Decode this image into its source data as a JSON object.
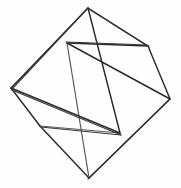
{
  "figure": {
    "type": "line-drawing",
    "width": 181,
    "height": 188,
    "background_color": "#fefefe",
    "stroke_color": "#2b2b2b",
    "stroke_color_light": "#5a5a5a",
    "stroke_width": 1.45,
    "vertex_count": 8,
    "edge_count": 12,
    "vertices": [
      {
        "id": "v-top",
        "label": "top",
        "x": 88,
        "y": 8
      },
      {
        "id": "v-upper-right",
        "label": "upper-right",
        "x": 148,
        "y": 46
      },
      {
        "id": "v-right",
        "label": "right",
        "x": 170,
        "y": 99
      },
      {
        "id": "v-bottom",
        "label": "bottom",
        "x": 89,
        "y": 178
      },
      {
        "id": "v-lower-left",
        "label": "lower-left",
        "x": 40,
        "y": 126
      },
      {
        "id": "v-left",
        "label": "left",
        "x": 11,
        "y": 88
      },
      {
        "id": "v-inner-upper",
        "label": "inner-upper",
        "x": 67,
        "y": 43
      },
      {
        "id": "v-inner-lower",
        "label": "inner-lower",
        "x": 120,
        "y": 133
      }
    ],
    "edges": [
      {
        "id": "e-1",
        "from": "v-top",
        "to": "v-upper-right",
        "path": "M 88 8 L 148 46",
        "weight": "normal"
      },
      {
        "id": "e-2",
        "from": "v-top",
        "to": "v-left",
        "path": "M 88 8 L 11 88",
        "weight": "normal"
      },
      {
        "id": "e-3",
        "from": "v-top",
        "to": "v-inner-lower",
        "path": "M 88 8 L 120 133",
        "weight": "normal"
      },
      {
        "id": "e-4",
        "from": "v-upper-right",
        "to": "v-right",
        "path": "M 148 46 L 170 99",
        "weight": "normal"
      },
      {
        "id": "e-5",
        "from": "v-upper-right",
        "to": "v-inner-upper",
        "path": "M 148 46 L 67 43",
        "weight": "normal"
      },
      {
        "id": "e-6",
        "from": "v-right",
        "to": "v-bottom",
        "path": "M 170 99 L 89 178",
        "weight": "normal"
      },
      {
        "id": "e-7",
        "from": "v-right",
        "to": "v-inner-upper",
        "path": "M 170 99 L 67 43",
        "weight": "normal"
      },
      {
        "id": "e-8",
        "from": "v-bottom",
        "to": "v-lower-left",
        "path": "M 89 178 L 40 126",
        "weight": "normal"
      },
      {
        "id": "e-9",
        "from": "v-bottom",
        "to": "v-inner-upper",
        "path": "M 89 178 L 67 43",
        "weight": "light"
      },
      {
        "id": "e-10",
        "from": "v-lower-left",
        "to": "v-left",
        "path": "M 40 126 L 11 88",
        "weight": "normal"
      },
      {
        "id": "e-11",
        "from": "v-lower-left",
        "to": "v-inner-lower",
        "path": "M 40 126 L 120 133",
        "weight": "light"
      },
      {
        "id": "e-12",
        "from": "v-left",
        "to": "v-inner-lower",
        "path": "M 11 88 L 120 133",
        "weight": "normal"
      }
    ],
    "sketch_overlays": [
      {
        "id": "o-1",
        "path": "M 89 9 L 149 47",
        "note": "double-stroke top-right"
      },
      {
        "id": "o-2",
        "path": "M 87 9 L 12 89",
        "note": "double-stroke top-left"
      },
      {
        "id": "o-3",
        "path": "M 169 100 L 88 179",
        "note": "double-stroke right-bottom"
      },
      {
        "id": "o-4",
        "path": "M 12 90 L 121 135",
        "note": "double-stroke left-inner"
      },
      {
        "id": "o-5",
        "path": "M 41 127 L 121 135",
        "note": "double-stroke lower-inner"
      },
      {
        "id": "o-6",
        "path": "M 147 45 L 66 42",
        "note": "double-stroke inner-upper"
      }
    ]
  }
}
